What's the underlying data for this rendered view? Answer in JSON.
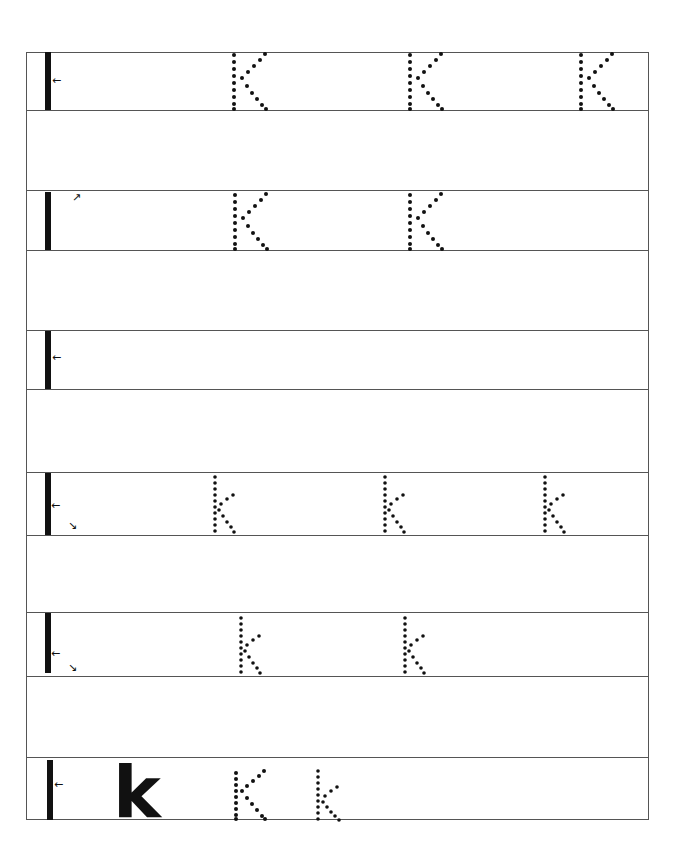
{
  "worksheet": {
    "letter_upper": "K",
    "letter_lower": "k",
    "rows": [
      {
        "case": "upper",
        "model": "K",
        "traces": 3
      },
      {
        "case": "upper",
        "model": "K",
        "traces": 2
      },
      {
        "case": "upper",
        "model": "K",
        "traces": 0
      },
      {
        "case": "lower",
        "model": "k",
        "traces": 3
      },
      {
        "case": "lower",
        "model": "k",
        "traces": 2
      },
      {
        "case": "mixed",
        "model": "K",
        "solid_example": "k",
        "traces_upper": 1,
        "traces_lower": 1
      }
    ],
    "colors": {
      "line": "#555555",
      "ink": "#111111"
    }
  }
}
